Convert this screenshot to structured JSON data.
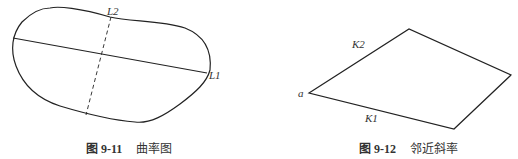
{
  "figures": [
    {
      "id": "fig-left",
      "caption_prefix": "图 9-11",
      "caption_title": "曲率图",
      "labels": {
        "l1": "L1",
        "l2": "L2"
      }
    },
    {
      "id": "fig-right",
      "caption_prefix": "图 9-12",
      "caption_title": "邻近斜率",
      "labels": {
        "a": "a",
        "k1": "K1",
        "k2": "K2"
      }
    }
  ],
  "colors": {
    "stroke": "#222222",
    "text": "#333333",
    "background": "#ffffff"
  }
}
